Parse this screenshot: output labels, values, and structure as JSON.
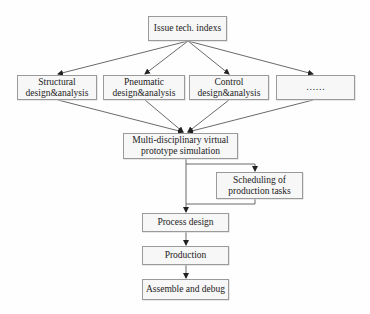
{
  "diagram": {
    "type": "flowchart",
    "nodes": [
      {
        "id": "issue",
        "label": "Issue tech. indexs"
      },
      {
        "id": "structural",
        "label": "Structural design&analysis"
      },
      {
        "id": "pneumatic",
        "label": "Pneumatic design&analysis"
      },
      {
        "id": "control",
        "label": "Control design&analysis"
      },
      {
        "id": "more",
        "label": "……"
      },
      {
        "id": "multi",
        "label": "Multi-disciplinary virtual prototype simulation"
      },
      {
        "id": "scheduling",
        "label": "Scheduling of production tasks"
      },
      {
        "id": "process",
        "label": "Process design"
      },
      {
        "id": "production",
        "label": "Production"
      },
      {
        "id": "assemble",
        "label": "Assemble and debug"
      }
    ],
    "edges": [
      {
        "from": "issue",
        "to": "structural"
      },
      {
        "from": "issue",
        "to": "pneumatic"
      },
      {
        "from": "issue",
        "to": "control"
      },
      {
        "from": "issue",
        "to": "more"
      },
      {
        "from": "structural",
        "to": "multi"
      },
      {
        "from": "pneumatic",
        "to": "multi"
      },
      {
        "from": "control",
        "to": "multi"
      },
      {
        "from": "more",
        "to": "multi"
      },
      {
        "from": "multi",
        "to": "scheduling"
      },
      {
        "from": "multi",
        "to": "process"
      },
      {
        "from": "scheduling",
        "to": "process"
      },
      {
        "from": "process",
        "to": "production"
      },
      {
        "from": "production",
        "to": "assemble"
      }
    ]
  },
  "labels": {
    "issue": "Issue tech. indexs",
    "structural_1": "Structural",
    "structural_2": "design&analysis",
    "pneumatic_1": "Pneumatic",
    "pneumatic_2": "design&analysis",
    "control_1": "Control",
    "control_2": "design&analysis",
    "more": "……",
    "multi_1": "Multi-disciplinary virtual",
    "multi_2": "prototype simulation",
    "scheduling_1": "Scheduling of",
    "scheduling_2": "production tasks",
    "process": "Process design",
    "production": "Production",
    "assemble": "Assemble and debug"
  },
  "colors": {
    "line": "#333333",
    "box_border": "#9a9a9a",
    "box_fill": "#f7f7f7"
  }
}
